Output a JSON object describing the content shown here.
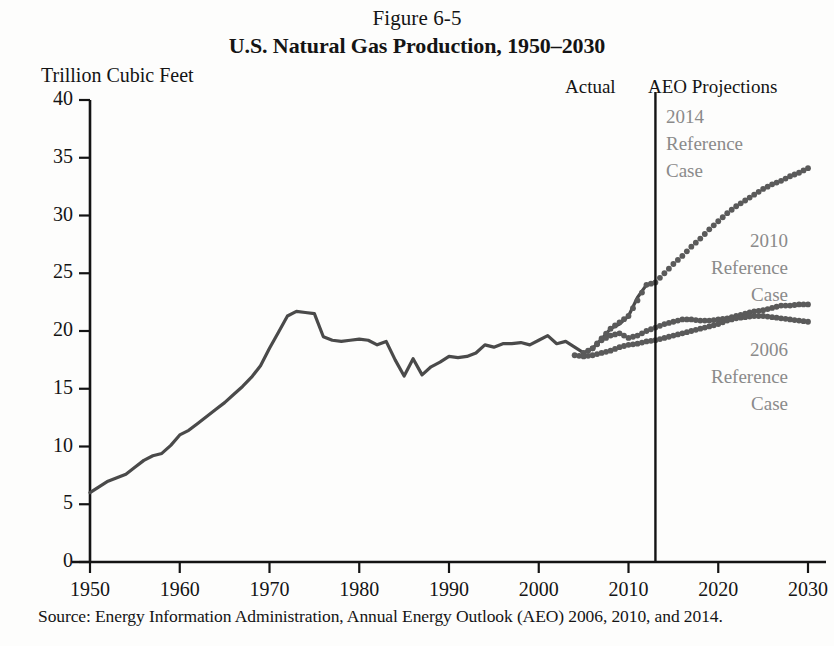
{
  "figure": {
    "number": "Figure 6-5",
    "title": "U.S. Natural Gas Production, 1950–2030",
    "source": "Source: Energy Information Administration, Annual Energy Outlook (AEO) 2006, 2010, and 2014."
  },
  "regions": {
    "actual_label": "Actual",
    "projections_label": "AEO Projections",
    "divider_year": 2013
  },
  "annotations": {
    "case_2014": "2014\nReference\nCase",
    "case_2010": "2010\nReference\nCase",
    "case_2006": "2006\nReference\nCase"
  },
  "colors": {
    "actual_line": "#4a4a4a",
    "projection_dots": "#5a5a5a",
    "annotation_text": "#8a8a8a",
    "axis": "#141414",
    "background": "#fdfdfc"
  },
  "chart_data": {
    "type": "line",
    "title": "U.S. Natural Gas Production, 1950–2030",
    "subtitle": "Figure 6-5",
    "xlabel": "",
    "ylabel": "Trillion Cubic Feet",
    "xlim": [
      1950,
      2030
    ],
    "ylim": [
      0,
      40
    ],
    "xticks": [
      1950,
      1960,
      1970,
      1980,
      1990,
      2000,
      2010,
      2020,
      2030
    ],
    "yticks": [
      0,
      5,
      10,
      15,
      20,
      25,
      30,
      35,
      40
    ],
    "grid": false,
    "legend_position": "inline-annotations",
    "annotations": [
      {
        "text": "Actual",
        "x": 2006,
        "y": 40.5
      },
      {
        "text": "AEO Projections",
        "x": 2021,
        "y": 40.5
      },
      {
        "text": "2014 Reference Case",
        "x": 2017,
        "y": 35.5
      },
      {
        "text": "2010 Reference Case",
        "x": 2026,
        "y": 25.5
      },
      {
        "text": "2006 Reference Case",
        "x": 2025,
        "y": 16.5
      }
    ],
    "divider_line": {
      "x": 2013,
      "label": "Actual / AEO Projections boundary"
    },
    "series": [
      {
        "name": "Actual",
        "style": "solid",
        "x": [
          1950,
          1951,
          1952,
          1953,
          1954,
          1955,
          1956,
          1957,
          1958,
          1959,
          1960,
          1961,
          1962,
          1963,
          1964,
          1965,
          1966,
          1967,
          1968,
          1969,
          1970,
          1971,
          1972,
          1973,
          1974,
          1975,
          1976,
          1977,
          1978,
          1979,
          1980,
          1981,
          1982,
          1983,
          1984,
          1985,
          1986,
          1987,
          1988,
          1989,
          1990,
          1991,
          1992,
          1993,
          1994,
          1995,
          1996,
          1997,
          1998,
          1999,
          2000,
          2001,
          2002,
          2003,
          2004,
          2005,
          2006,
          2007,
          2008,
          2009,
          2010,
          2011,
          2012,
          2013
        ],
        "values": [
          6.0,
          6.5,
          7.0,
          7.3,
          7.6,
          8.2,
          8.8,
          9.2,
          9.4,
          10.1,
          11.0,
          11.4,
          12.0,
          12.6,
          13.2,
          13.8,
          14.5,
          15.2,
          16.0,
          17.0,
          18.5,
          19.9,
          21.3,
          21.7,
          21.6,
          21.5,
          19.5,
          19.2,
          19.1,
          19.2,
          19.3,
          19.2,
          18.8,
          19.1,
          17.5,
          16.1,
          17.6,
          16.2,
          16.9,
          17.3,
          17.8,
          17.7,
          17.8,
          18.1,
          18.8,
          18.6,
          18.9,
          18.9,
          19.0,
          18.8,
          19.2,
          19.6,
          18.9,
          19.1,
          18.6,
          18.1,
          18.5,
          19.3,
          20.2,
          20.6,
          21.3,
          22.9,
          24.0,
          24.2
        ],
        "color": "#4a4a4a"
      },
      {
        "name": "2014 Reference Case",
        "style": "dotted",
        "x": [
          2006,
          2008,
          2010,
          2012,
          2013,
          2014,
          2015,
          2016,
          2017,
          2018,
          2019,
          2020,
          2021,
          2022,
          2023,
          2024,
          2025,
          2026,
          2027,
          2028,
          2029,
          2030
        ],
        "values": [
          18.5,
          20.2,
          21.3,
          24.0,
          24.2,
          25.0,
          25.8,
          26.5,
          27.3,
          28.0,
          28.8,
          29.5,
          30.2,
          30.8,
          31.3,
          31.8,
          32.3,
          32.7,
          33.0,
          33.4,
          33.7,
          34.1
        ],
        "color": "#5a5a5a"
      },
      {
        "name": "2010 Reference Case",
        "style": "dotted",
        "x": [
          2005,
          2006,
          2007,
          2008,
          2009,
          2010,
          2011,
          2012,
          2013,
          2014,
          2015,
          2016,
          2017,
          2018,
          2019,
          2020,
          2021,
          2022,
          2023,
          2024,
          2025,
          2026,
          2027,
          2028,
          2029,
          2030
        ],
        "values": [
          18.1,
          18.5,
          19.2,
          19.6,
          19.8,
          19.4,
          19.6,
          20.0,
          20.3,
          20.6,
          20.8,
          21.0,
          21.0,
          20.9,
          20.9,
          21.0,
          21.1,
          21.3,
          21.5,
          21.7,
          21.8,
          22.0,
          22.2,
          22.2,
          22.3,
          22.3
        ],
        "color": "#5a5a5a"
      },
      {
        "name": "2006 Reference Case",
        "style": "dotted",
        "x": [
          2004,
          2005,
          2006,
          2007,
          2008,
          2009,
          2010,
          2011,
          2012,
          2013,
          2014,
          2015,
          2016,
          2017,
          2018,
          2019,
          2020,
          2021,
          2022,
          2023,
          2024,
          2025,
          2026,
          2027,
          2028,
          2029,
          2030
        ],
        "values": [
          17.9,
          17.8,
          17.9,
          18.1,
          18.3,
          18.6,
          18.8,
          18.9,
          19.1,
          19.2,
          19.4,
          19.6,
          19.8,
          20.0,
          20.2,
          20.4,
          20.6,
          20.9,
          21.1,
          21.2,
          21.3,
          21.3,
          21.2,
          21.1,
          21.0,
          20.9,
          20.8
        ],
        "color": "#5a5a5a"
      }
    ]
  }
}
